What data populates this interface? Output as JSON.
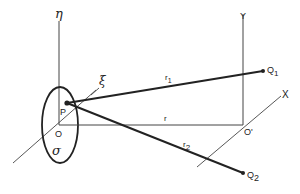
{
  "diagram": {
    "labels": {
      "eta": "η",
      "xi": "ξ",
      "sigma": "σ",
      "P": "P",
      "O": "O",
      "O_prime": "O'",
      "Y": "Y",
      "X": "X",
      "r": "r",
      "r1": "r",
      "r1_sub": "1",
      "r2": "r",
      "r2_sub": "2",
      "Q1": "Q",
      "Q1_sub": "1",
      "Q2": "Q",
      "Q2_sub": "2"
    },
    "colors": {
      "line": "#222222",
      "thin_line": "#444444",
      "background": "#ffffff"
    }
  }
}
